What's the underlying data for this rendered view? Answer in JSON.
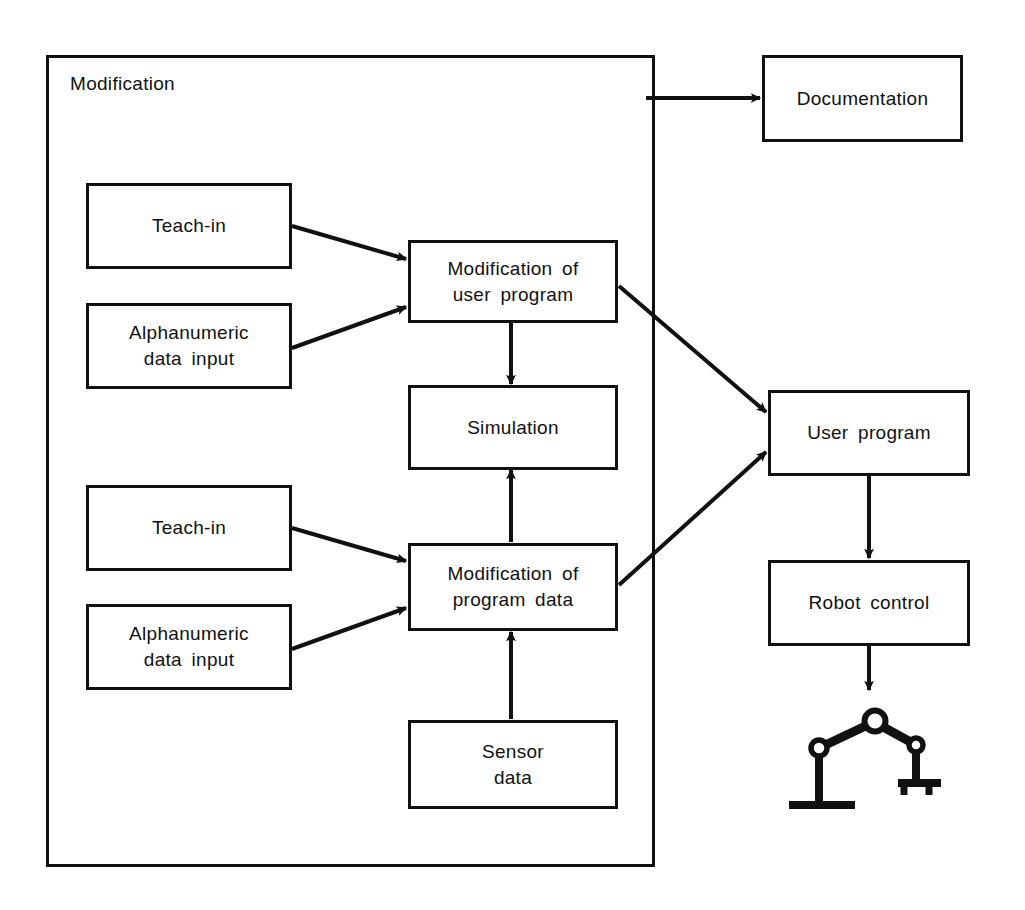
{
  "diagram": {
    "title": "Modification",
    "container": {
      "label": "Modification"
    },
    "boxes": [
      {
        "id": "teach-in-top",
        "label": "Teach-in"
      },
      {
        "id": "alphanumeric-top",
        "label": "Alphanumeric\ndata input"
      },
      {
        "id": "modification-user-program",
        "label": "Modification  of\nuser  program"
      },
      {
        "id": "simulation",
        "label": "Simulation"
      },
      {
        "id": "teach-in-bottom",
        "label": "Teach-in"
      },
      {
        "id": "alphanumeric-bottom",
        "label": "Alphanumeric\ndata input"
      },
      {
        "id": "modification-program-data",
        "label": "Modification  of\nprogram  data"
      },
      {
        "id": "sensor-data",
        "label": "Sensor\ndata"
      },
      {
        "id": "documentation",
        "label": "Documentation"
      },
      {
        "id": "user-program",
        "label": "User  program"
      },
      {
        "id": "robot-control",
        "label": "Robot control"
      }
    ],
    "icons": [
      {
        "id": "robot-manipulator",
        "name": "robot-arm-icon"
      }
    ],
    "colors": {
      "stroke": "#111111",
      "background": "#ffffff",
      "text": "#111111"
    },
    "edges": [
      {
        "from": "modification-container",
        "to": "documentation",
        "style": "arrow"
      },
      {
        "from": "teach-in-top",
        "to": "modification-user-program",
        "style": "arrow"
      },
      {
        "from": "alphanumeric-top",
        "to": "modification-user-program",
        "style": "arrow"
      },
      {
        "from": "modification-user-program",
        "to": "simulation",
        "style": "arrow"
      },
      {
        "from": "modification-user-program",
        "to": "user-program",
        "style": "arrow"
      },
      {
        "from": "teach-in-bottom",
        "to": "modification-program-data",
        "style": "arrow"
      },
      {
        "from": "alphanumeric-bottom",
        "to": "modification-program-data",
        "style": "arrow"
      },
      {
        "from": "modification-program-data",
        "to": "simulation",
        "style": "arrow"
      },
      {
        "from": "modification-program-data",
        "to": "user-program",
        "style": "arrow"
      },
      {
        "from": "sensor-data",
        "to": "modification-program-data",
        "style": "arrow"
      },
      {
        "from": "user-program",
        "to": "robot-control",
        "style": "arrow"
      },
      {
        "from": "robot-control",
        "to": "robot-manipulator",
        "style": "arrow"
      }
    ]
  }
}
